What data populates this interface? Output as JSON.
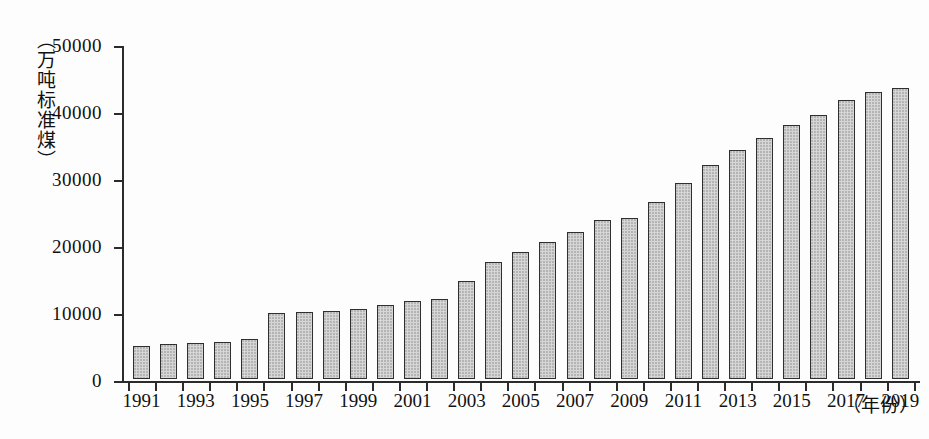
{
  "chart_data": {
    "type": "bar",
    "title": "",
    "subtitle": "",
    "xlabel": "（年份）",
    "ylabel": "（万吨标准煤）",
    "ylim": [
      0,
      50000
    ],
    "y_ticks": [
      0,
      10000,
      20000,
      30000,
      40000,
      50000
    ],
    "y_tick_labels": [
      "0",
      "10000",
      "20000",
      "30000",
      "40000",
      "50000"
    ],
    "grid": false,
    "legend": null,
    "x_tick_labels": [
      "1991",
      "1993",
      "1995",
      "1997",
      "1999",
      "2001",
      "2003",
      "2005",
      "2007",
      "2009",
      "2011",
      "2013",
      "2015",
      "2017",
      "2019"
    ],
    "categories": [
      "1991",
      "1992",
      "1993",
      "1994",
      "1995",
      "1996",
      "1997",
      "1998",
      "1999",
      "2000",
      "2001",
      "2002",
      "2003",
      "2004",
      "2005",
      "2006",
      "2007",
      "2008",
      "2009",
      "2010",
      "2011",
      "2012",
      "2013",
      "2014",
      "2015",
      "2016",
      "2017",
      "2018",
      "2019"
    ],
    "values": [
      4900,
      5200,
      5350,
      5500,
      6000,
      9900,
      9950,
      10100,
      10500,
      11100,
      11700,
      12000,
      14700,
      17400,
      18900,
      20500,
      22000,
      23700,
      24000,
      26400,
      29300,
      32000,
      34200,
      35900,
      37900,
      39400,
      41600,
      42900,
      43400
    ],
    "bar_color": "#d6d6d6",
    "bar_edge_color": "#2f2f2f",
    "axis_color": "#2b2b2b",
    "background_color": "#fdfdfd"
  }
}
